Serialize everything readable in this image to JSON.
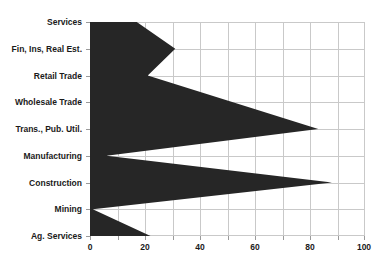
{
  "chart_data": {
    "type": "area",
    "orientation": "horizontal",
    "title": "",
    "xlabel": "",
    "ylabel": "",
    "xlim": [
      0,
      100
    ],
    "grid": true,
    "legend": null,
    "fill_color": "#262626",
    "grid_color": "#c9c9c9",
    "categories": [
      "Services",
      "Fin, Ins, Real Est.",
      "Retail Trade",
      "Wholesale Trade",
      "Trans., Pub. Util.",
      "Manufacturing",
      "Construction",
      "Mining",
      "Ag. Services"
    ],
    "values": [
      17,
      31,
      21,
      52,
      83,
      6,
      88,
      1,
      22
    ],
    "xticks": [
      0,
      20,
      40,
      60,
      80,
      100
    ],
    "xtick_labels": [
      "0",
      "20",
      "40",
      "60",
      "80",
      "100"
    ],
    "minor_xticks": [
      10,
      30,
      50,
      70,
      90
    ]
  }
}
